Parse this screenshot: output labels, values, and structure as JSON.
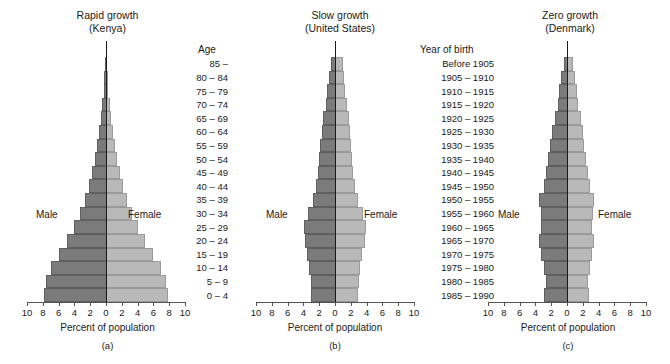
{
  "figure": {
    "axis_title": "Percent of population",
    "tick_labels": [
      "10",
      "8",
      "6",
      "4",
      "2",
      "0",
      "2",
      "4",
      "6",
      "8",
      "10"
    ],
    "tick_values": [
      -10,
      -8,
      -6,
      -4,
      -2,
      0,
      2,
      4,
      6,
      8,
      10
    ],
    "male_label": "Male",
    "female_label": "Female",
    "male_color": "#7b7b7b",
    "female_color": "#b9b9b9"
  },
  "age_column": {
    "header": "Age",
    "items": [
      "85 –",
      "80 – 84",
      "75 – 79",
      "70 – 74",
      "65 – 69",
      "60 – 64",
      "55 – 59",
      "50 – 54",
      "45 – 49",
      "40 – 44",
      "35 – 39",
      "30 – 34",
      "25 – 29",
      "20 – 24",
      "15 – 19",
      "10 – 14",
      "5 – 9",
      "0 – 4"
    ]
  },
  "birth_column": {
    "header": "Year of birth",
    "items": [
      "Before 1905",
      "1905 – 1910",
      "1910 – 1915",
      "1915 – 1920",
      "1920 – 1925",
      "1925 – 1930",
      "1930 – 1935",
      "1935 – 1940",
      "1940 – 1945",
      "1945 – 1950",
      "1950 – 1955",
      "1955 – 1960",
      "1960 – 1965",
      "1965 – 1970",
      "1970 – 1975",
      "1975 – 1980",
      "1980 – 1985",
      "1985 – 1990"
    ]
  },
  "panels": [
    {
      "key": "a",
      "letter": "(a)",
      "title_line1": "Rapid growth",
      "title_line2": "(Kenya)",
      "male": [
        0.12,
        0.2,
        0.3,
        0.45,
        0.65,
        0.9,
        1.15,
        1.45,
        1.8,
        2.2,
        2.7,
        3.3,
        4.0,
        4.9,
        6.0,
        7.0,
        7.6,
        7.9
      ],
      "female": [
        0.12,
        0.2,
        0.3,
        0.45,
        0.65,
        0.9,
        1.15,
        1.45,
        1.8,
        2.2,
        2.7,
        3.3,
        4.0,
        4.9,
        6.0,
        7.0,
        7.6,
        7.9
      ]
    },
    {
      "key": "b",
      "letter": "(b)",
      "title_line1": "Slow growth",
      "title_line2": "(United States)",
      "male": [
        0.55,
        0.75,
        0.95,
        1.2,
        1.5,
        1.7,
        1.85,
        2.05,
        2.2,
        2.45,
        2.8,
        3.45,
        3.95,
        3.85,
        3.55,
        3.3,
        3.1,
        3.0
      ],
      "female": [
        0.95,
        1.1,
        1.3,
        1.5,
        1.75,
        1.9,
        2.0,
        2.15,
        2.25,
        2.5,
        2.85,
        3.5,
        3.95,
        3.8,
        3.45,
        3.2,
        3.0,
        2.9
      ]
    },
    {
      "key": "c",
      "letter": "(c)",
      "title_line1": "Zero growth",
      "title_line2": "(Denmark)",
      "male": [
        0.35,
        0.7,
        0.95,
        1.2,
        1.55,
        1.85,
        2.1,
        2.35,
        2.6,
        2.95,
        3.5,
        3.35,
        3.25,
        3.55,
        3.3,
        2.95,
        2.7,
        2.9
      ],
      "female": [
        0.75,
        1.05,
        1.25,
        1.45,
        1.75,
        2.0,
        2.2,
        2.4,
        2.6,
        2.95,
        3.45,
        3.3,
        3.2,
        3.45,
        3.2,
        2.85,
        2.6,
        2.8
      ]
    }
  ],
  "chart_data": {
    "type": "bar",
    "xlabel": "Percent of population",
    "ylabel": "Age / Year of birth",
    "xlim": [
      -10,
      10
    ],
    "xticks": [
      -10,
      -8,
      -6,
      -4,
      -2,
      0,
      2,
      4,
      6,
      8,
      10
    ],
    "xticklabels": [
      "10",
      "8",
      "6",
      "4",
      "2",
      "0",
      "2",
      "4",
      "6",
      "8",
      "10"
    ],
    "grid": false,
    "legend": [
      "Male",
      "Female"
    ],
    "legend_position": "inside-plot",
    "orientation": "horizontal-diverging",
    "categories_age": [
      "85 –",
      "80 – 84",
      "75 – 79",
      "70 – 74",
      "65 – 69",
      "60 – 64",
      "55 – 59",
      "50 – 54",
      "45 – 49",
      "40 – 44",
      "35 – 39",
      "30 – 34",
      "25 – 29",
      "20 – 24",
      "15 – 19",
      "10 – 14",
      "5 – 9",
      "0 – 4"
    ],
    "categories_year_of_birth": [
      "Before 1905",
      "1905 – 1910",
      "1910 – 1915",
      "1915 – 1920",
      "1920 – 1925",
      "1925 – 1930",
      "1930 – 1935",
      "1935 – 1940",
      "1940 – 1945",
      "1945 – 1950",
      "1950 – 1955",
      "1955 – 1960",
      "1960 – 1965",
      "1965 – 1970",
      "1970 – 1975",
      "1975 – 1980",
      "1980 – 1985",
      "1985 – 1990"
    ],
    "panels": [
      {
        "label": "(a)",
        "name": "Rapid growth (Kenya)",
        "series": [
          {
            "name": "Male",
            "values": [
              0.12,
              0.2,
              0.3,
              0.45,
              0.65,
              0.9,
              1.15,
              1.45,
              1.8,
              2.2,
              2.7,
              3.3,
              4.0,
              4.9,
              6.0,
              7.0,
              7.6,
              7.9
            ]
          },
          {
            "name": "Female",
            "values": [
              0.12,
              0.2,
              0.3,
              0.45,
              0.65,
              0.9,
              1.15,
              1.45,
              1.8,
              2.2,
              2.7,
              3.3,
              4.0,
              4.9,
              6.0,
              7.0,
              7.6,
              7.9
            ]
          }
        ]
      },
      {
        "label": "(b)",
        "name": "Slow growth (United States)",
        "series": [
          {
            "name": "Male",
            "values": [
              0.55,
              0.75,
              0.95,
              1.2,
              1.5,
              1.7,
              1.85,
              2.05,
              2.2,
              2.45,
              2.8,
              3.45,
              3.95,
              3.85,
              3.55,
              3.3,
              3.1,
              3.0
            ]
          },
          {
            "name": "Female",
            "values": [
              0.95,
              1.1,
              1.3,
              1.5,
              1.75,
              1.9,
              2.0,
              2.15,
              2.25,
              2.5,
              2.85,
              3.5,
              3.95,
              3.8,
              3.45,
              3.2,
              3.0,
              2.9
            ]
          }
        ]
      },
      {
        "label": "(c)",
        "name": "Zero growth (Denmark)",
        "series": [
          {
            "name": "Male",
            "values": [
              0.35,
              0.7,
              0.95,
              1.2,
              1.55,
              1.85,
              2.1,
              2.35,
              2.6,
              2.95,
              3.5,
              3.35,
              3.25,
              3.55,
              3.3,
              2.95,
              2.7,
              2.9
            ]
          },
          {
            "name": "Female",
            "values": [
              0.75,
              1.05,
              1.25,
              1.45,
              1.75,
              2.0,
              2.2,
              2.4,
              2.6,
              2.95,
              3.45,
              3.3,
              3.2,
              3.45,
              3.2,
              2.85,
              2.6,
              2.8
            ]
          }
        ]
      }
    ]
  }
}
